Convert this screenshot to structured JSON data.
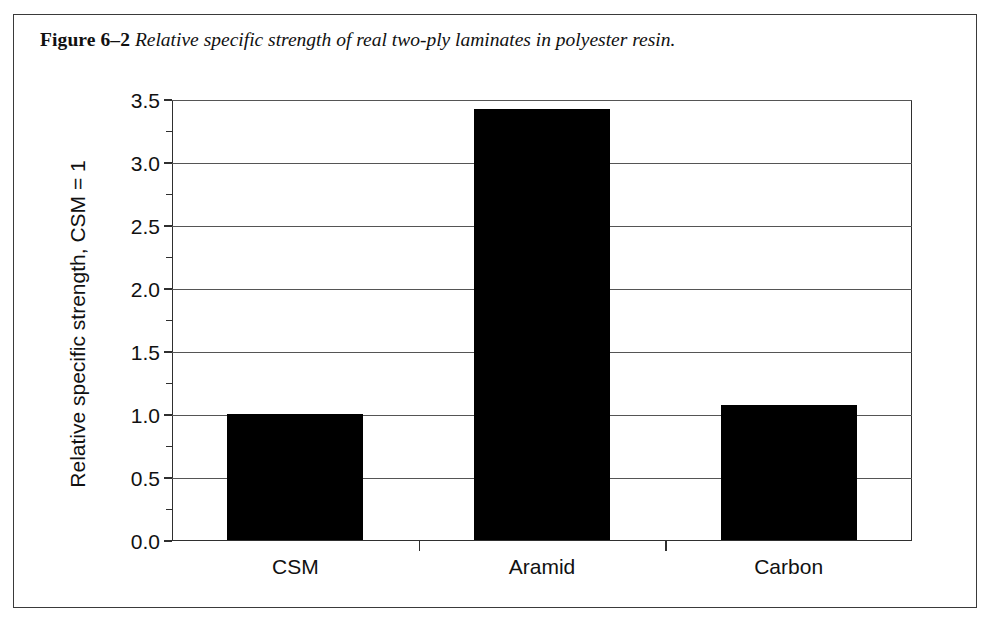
{
  "figure": {
    "caption_label": "Figure 6–2",
    "caption_text": "Relative specific strength of real two-ply laminates in polyester resin."
  },
  "chart_data": {
    "type": "bar",
    "title": "",
    "xlabel": "",
    "ylabel": "Relative specific strength, CSM = 1",
    "categories": [
      "CSM",
      "Aramid",
      "Carbon"
    ],
    "values": [
      1.0,
      3.42,
      1.07
    ],
    "ylim": [
      0.0,
      3.5
    ],
    "ytick_labels": [
      "0.0",
      "0.5",
      "1.0",
      "1.5",
      "2.0",
      "2.5",
      "3.0",
      "3.5"
    ],
    "ytick_values": [
      0.0,
      0.5,
      1.0,
      1.5,
      2.0,
      2.5,
      3.0,
      3.5
    ],
    "minor_tick_step": 0.25,
    "grid": "horizontal",
    "legend": "none",
    "bar_color": "#000000",
    "axis_color": "#2f2f2f",
    "gridline_color": "#555555",
    "frame_color": "#3a3a3a",
    "background": "#ffffff"
  }
}
